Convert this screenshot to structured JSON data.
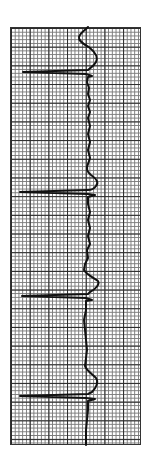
{
  "strip": {
    "type": "ecg-rhythm-strip",
    "orientation": "vertical",
    "grid_color_major": "#2a2a2a",
    "grid_color_minor": "#7a7a7a",
    "trace_color": "#111111",
    "beats_visible": 4
  }
}
